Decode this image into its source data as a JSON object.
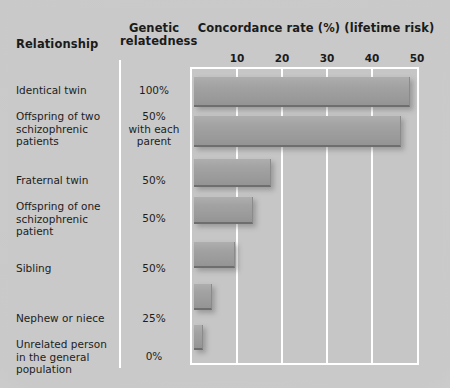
{
  "headers": {
    "relationship": "Relationship",
    "genetic": "Genetic\nrelatedness",
    "concordance": "Concordance rate (%)\n(lifetime risk)"
  },
  "colors": {
    "paper_background": "#c9c9c9",
    "plot_background": "#c6c6c6",
    "gridline": "#ffffff",
    "bar_fill": "#9e9e9e",
    "bar_shadow": "#6e6e6e",
    "text": "#1b1b1b"
  },
  "chart_data": {
    "type": "bar",
    "orientation": "horizontal",
    "title": "Concordance rate (%)\n(lifetime risk)",
    "xlabel": "Concordance rate (%) (lifetime risk)",
    "ylabel": "Relationship",
    "xlim": [
      0,
      50
    ],
    "xticks": [
      10,
      20,
      30,
      40,
      50
    ],
    "xtick_labels": [
      "10",
      "20",
      "30",
      "40",
      "50"
    ],
    "grid": true,
    "legend": "none",
    "categories": [
      "Identical twin",
      "Offspring of two schizophrenic patients",
      "Fraternal twin",
      "Offspring of one schizophrenic patient",
      "Sibling",
      "Nephew or niece",
      "Unrelated person in the general population"
    ],
    "values": [
      48,
      46,
      17,
      13,
      9,
      4,
      2
    ],
    "genetic_relatedness": [
      "100%",
      "50% with each parent",
      "50%",
      "50%",
      "50%",
      "25%",
      "0%"
    ]
  },
  "rows": [
    {
      "label": "Identical twin",
      "genetic": "100%",
      "value": 48,
      "label_top": 84,
      "gen_top": 84,
      "bar_top": 8,
      "bar_height": 30
    },
    {
      "label": "Offspring of two\nschizophrenic\npatients",
      "genetic": "50%\nwith each\nparent",
      "value": 46,
      "label_top": 110,
      "gen_top": 110,
      "bar_top": 47,
      "bar_height": 31
    },
    {
      "label": "Fraternal twin",
      "genetic": "50%",
      "value": 17,
      "label_top": 174,
      "gen_top": 174,
      "bar_top": 90,
      "bar_height": 28
    },
    {
      "label": "Offspring of one\nschizophrenic\npatient",
      "genetic": "50%",
      "value": 13,
      "label_top": 200,
      "gen_top": 212,
      "bar_top": 128,
      "bar_height": 27
    },
    {
      "label": "Sibling",
      "genetic": "50%",
      "value": 9,
      "label_top": 262,
      "gen_top": 262,
      "bar_top": 173,
      "bar_height": 26
    },
    {
      "label": "Nephew or niece",
      "genetic": "25%",
      "value": 4,
      "label_top": 312,
      "gen_top": 312,
      "bar_top": 215,
      "bar_height": 26
    },
    {
      "label": "Unrelated person\nin the general\npopulation",
      "genetic": "0%",
      "value": 2,
      "label_top": 338,
      "gen_top": 350,
      "bar_top": 256,
      "bar_height": 25
    }
  ]
}
